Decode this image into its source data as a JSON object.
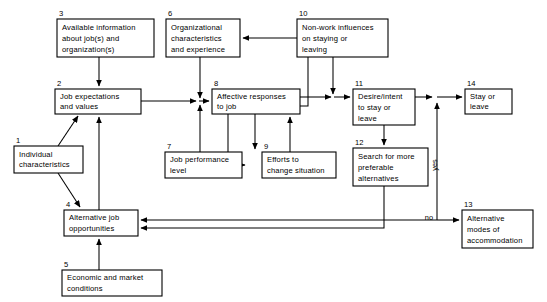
{
  "diagram": {
    "nodes": [
      {
        "id": "n1",
        "number": "1",
        "lines": [
          "Individual",
          "characteristics"
        ],
        "x": 14,
        "y": 146,
        "w": 69,
        "h": 27,
        "num_x": 16,
        "num_y": 143
      },
      {
        "id": "n2",
        "number": "2",
        "lines": [
          "Job expectations",
          "and values"
        ],
        "x": 55,
        "y": 89,
        "w": 86,
        "h": 25,
        "num_x": 57,
        "num_y": 86
      },
      {
        "id": "n3",
        "number": "3",
        "lines": [
          "Available information",
          "about job(s) and",
          "organization(s)"
        ],
        "x": 57,
        "y": 19,
        "w": 97,
        "h": 38,
        "num_x": 59,
        "num_y": 16
      },
      {
        "id": "n4",
        "number": "4",
        "lines": [
          "Alternative job",
          "opportunities"
        ],
        "x": 64,
        "y": 210,
        "w": 74,
        "h": 26,
        "num_x": 66,
        "num_y": 207
      },
      {
        "id": "n5",
        "number": "5",
        "lines": [
          "Economic and market",
          "conditions"
        ],
        "x": 62,
        "y": 270,
        "w": 100,
        "h": 26,
        "num_x": 64,
        "num_y": 267
      },
      {
        "id": "n6",
        "number": "6",
        "lines": [
          "Organizational",
          "characteristics",
          "and experience"
        ],
        "x": 166,
        "y": 19,
        "w": 74,
        "h": 38,
        "num_x": 168,
        "num_y": 16
      },
      {
        "id": "n7",
        "number": "7",
        "lines": [
          "Job performance",
          "level"
        ],
        "x": 165,
        "y": 152,
        "w": 77,
        "h": 26,
        "num_x": 167,
        "num_y": 149
      },
      {
        "id": "n8",
        "number": "8",
        "lines": [
          "Affective responses",
          "to job"
        ],
        "x": 212,
        "y": 89,
        "w": 88,
        "h": 25,
        "num_x": 214,
        "num_y": 86
      },
      {
        "id": "n9",
        "number": "9",
        "lines": [
          "Efforts to",
          "change situation"
        ],
        "x": 262,
        "y": 152,
        "w": 74,
        "h": 26,
        "num_x": 264,
        "num_y": 149
      },
      {
        "id": "n10",
        "number": "10",
        "lines": [
          "Non-work influences",
          "on staying or",
          "leaving"
        ],
        "x": 297,
        "y": 19,
        "w": 91,
        "h": 38,
        "num_x": 299,
        "num_y": 16
      },
      {
        "id": "n11",
        "number": "11",
        "lines": [
          "Desire/intent",
          "to stay or",
          "leave"
        ],
        "x": 353,
        "y": 89,
        "w": 62,
        "h": 36,
        "num_x": 355,
        "num_y": 86
      },
      {
        "id": "n12",
        "number": "12",
        "lines": [
          "Search for more",
          "preferable",
          "alternatives"
        ],
        "x": 353,
        "y": 148,
        "w": 75,
        "h": 38,
        "num_x": 355,
        "num_y": 145
      },
      {
        "id": "n13",
        "number": "13",
        "lines": [
          "Alternative",
          "modes of",
          "accommodation"
        ],
        "x": 462,
        "y": 210,
        "w": 71,
        "h": 38,
        "num_x": 464,
        "num_y": 207
      },
      {
        "id": "n14",
        "number": "14",
        "lines": [
          "Stay or",
          "leave"
        ],
        "x": 465,
        "y": 89,
        "w": 47,
        "h": 25,
        "num_x": 467,
        "num_y": 86
      }
    ],
    "edge_labels": [
      {
        "id": "yes",
        "text": "yes",
        "x": 437,
        "y": 165,
        "rotated": true
      },
      {
        "id": "no",
        "text": "no",
        "x": 433,
        "y": 220,
        "rotated": false
      }
    ]
  }
}
